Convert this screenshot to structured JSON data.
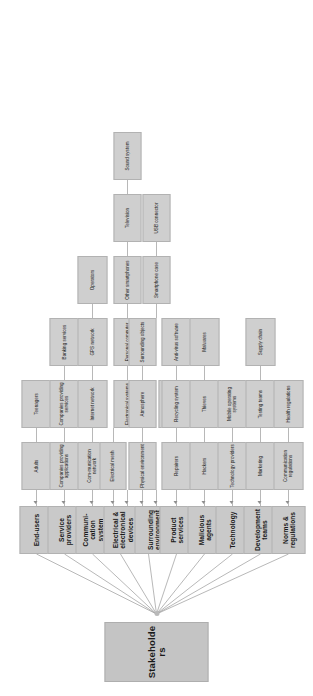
{
  "diagram": {
    "title": "Stakeholders",
    "root": {
      "label": "Stakeholders"
    },
    "colors": {
      "node_fill": "#c9c9c9",
      "sub_fill": "#cfcfcf",
      "node_border": "#b2b2b2",
      "link": "#9a9a9a",
      "text": "#1a1a1a",
      "background": "#ffffff"
    },
    "categories": [
      {
        "label": "End-users",
        "children": [
          {
            "label": "Adults"
          },
          {
            "label": "Teenagers"
          }
        ]
      },
      {
        "label": "Service providers",
        "children": [
          {
            "label": "Companies providing applications"
          },
          {
            "label": "Companies providing services"
          },
          {
            "label": "Banking services"
          }
        ]
      },
      {
        "label": "Communi-cation system",
        "children": [
          {
            "label": "Com-munication network"
          },
          {
            "label": "Internet network"
          },
          {
            "label": "GPS network"
          },
          {
            "label": "Operators"
          }
        ]
      },
      {
        "label": "Electrical & electronical devices",
        "children": [
          {
            "label": "Electrical mesh"
          },
          {
            "label": "Electronical systems"
          },
          {
            "label": "Personal computer"
          },
          {
            "label": "Other smartphones"
          },
          {
            "label": "Television"
          },
          {
            "label": "Sound system"
          }
        ]
      },
      {
        "label": "Surrounding environment",
        "children": [
          {
            "label": "Physical environment"
          },
          {
            "label": "Atmosphere"
          },
          {
            "label": "Surrounding objects"
          },
          {
            "label": "Customised case"
          },
          {
            "label": "Smartphone case"
          },
          {
            "label": "USB connector"
          }
        ]
      },
      {
        "label": "Product services",
        "children": [
          {
            "label": "Repairers"
          },
          {
            "label": "Recycling system"
          },
          {
            "label": "Anti-virus software"
          }
        ]
      },
      {
        "label": "Malicious agents",
        "children": [
          {
            "label": "Hackers"
          },
          {
            "label": "Thieves"
          },
          {
            "label": "Malwares"
          }
        ]
      },
      {
        "label": "Technology",
        "children": [
          {
            "label": "Technology providers"
          },
          {
            "label": "Mobile operating systems"
          }
        ]
      },
      {
        "label": "Development teams",
        "children": [
          {
            "label": "Marketing"
          },
          {
            "label": "Testing teams"
          },
          {
            "label": "Supply chain"
          }
        ]
      },
      {
        "label": "Norms & regulations",
        "children": [
          {
            "label": "Communication regulations"
          },
          {
            "label": "Health regulations"
          }
        ]
      }
    ]
  }
}
